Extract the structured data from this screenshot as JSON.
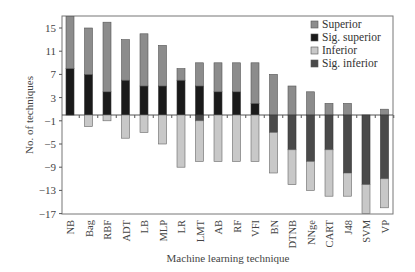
{
  "chart_data": {
    "type": "bar",
    "stacked": true,
    "title": "",
    "xlabel": "Machine learning technique",
    "ylabel": "No. of techniques",
    "ylim": [
      -17,
      17
    ],
    "yticks": [
      15,
      11,
      7,
      3,
      -1,
      -5,
      -9,
      -13,
      -17
    ],
    "grid": false,
    "legend_position": "upper right",
    "categories": [
      "NB",
      "Bag",
      "RBF",
      "ADT",
      "LB",
      "MLP",
      "LR",
      "LMT",
      "AB",
      "RF",
      "VFI",
      "BN",
      "DTNB",
      "NNge",
      "CART",
      "J48",
      "SVM",
      "VP"
    ],
    "series": [
      {
        "name": "Superior",
        "color": "#8c8c8c",
        "values": [
          9,
          8,
          12,
          7,
          9,
          7,
          2,
          4,
          5,
          5,
          7,
          7,
          5,
          4,
          2,
          2,
          0,
          1
        ]
      },
      {
        "name": "Sig. superior",
        "color": "#1a1a1a",
        "values": [
          8,
          7,
          4,
          6,
          5,
          5,
          6,
          5,
          4,
          4,
          2,
          0,
          0,
          0,
          0,
          0,
          0,
          0
        ]
      },
      {
        "name": "Inferior",
        "color": "#c8c8c8",
        "values": [
          0,
          -2,
          -1,
          -4,
          -3,
          -5,
          -9,
          -7,
          -8,
          -8,
          -8,
          -7,
          -6,
          -5,
          -8,
          -4,
          -5,
          -5
        ]
      },
      {
        "name": "Sig. inferior",
        "color": "#4a4a4a",
        "values": [
          0,
          0,
          0,
          0,
          0,
          0,
          0,
          -1,
          0,
          0,
          0,
          -3,
          -6,
          -8,
          -6,
          -10,
          -12,
          -11
        ]
      }
    ],
    "totals": {
      "positive": [
        17,
        15,
        16,
        13,
        14,
        12,
        8,
        9,
        9,
        9,
        9,
        7,
        5,
        4,
        2,
        2,
        0,
        1
      ],
      "negative": [
        0,
        -2,
        -1,
        -4,
        -3,
        -5,
        -9,
        -8,
        -8,
        -8,
        -8,
        -10,
        -12,
        -13,
        -14,
        -14,
        -17,
        -16
      ]
    }
  },
  "legend": {
    "items": [
      {
        "label": "Superior",
        "color": "#8c8c8c"
      },
      {
        "label": "Sig. superior",
        "color": "#1a1a1a"
      },
      {
        "label": "Inferior",
        "color": "#c8c8c8"
      },
      {
        "label": "Sig. inferior",
        "color": "#4a4a4a"
      }
    ]
  }
}
